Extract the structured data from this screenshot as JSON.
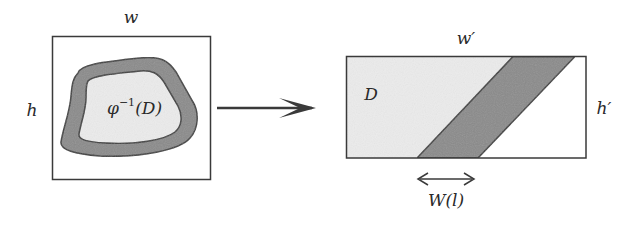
{
  "figure": {
    "left_panel": {
      "width_label": "w",
      "height_label": "h",
      "region_label": "φ",
      "region_label_sup": "−1",
      "region_label_arg": "(D)"
    },
    "mapping_arrow": {
      "direction": "left-to-right"
    },
    "right_panel": {
      "width_label": "w′",
      "height_label": "h′",
      "region_label": "D",
      "band_width_label": "W(l)"
    },
    "colors": {
      "outline": "#3a3a3a",
      "light_fill": "#ececec",
      "band_fill": "#8a8a8a",
      "background": "#ffffff"
    }
  }
}
